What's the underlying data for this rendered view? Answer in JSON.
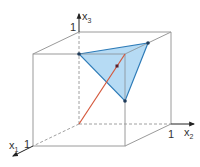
{
  "diagram": {
    "type": "unit cube with triangle cross-section",
    "axes": {
      "x1": {
        "label": "x",
        "subscript": "1",
        "tick": "1"
      },
      "x2": {
        "label": "x",
        "subscript": "2",
        "tick": "1"
      },
      "x3": {
        "label": "x",
        "subscript": "3",
        "tick": "1"
      }
    },
    "colors": {
      "cube_edge": "#9a9a9a",
      "dashed_edge": "#a0a0a0",
      "triangle_fill": "#a9d5f2",
      "triangle_edge": "#2f7cb8",
      "vertex": "#1f3b5a",
      "diagonal": "#d4583c",
      "point": "#5a1f2a",
      "axis": "#222222"
    }
  }
}
